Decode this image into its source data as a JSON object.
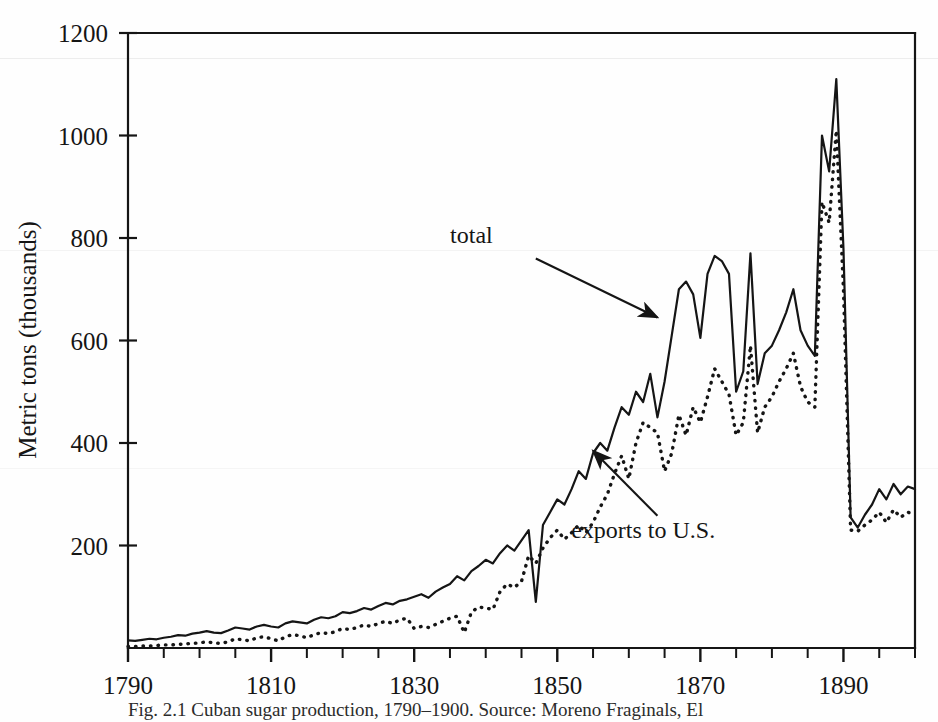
{
  "figure": {
    "caption": "Fig. 2.1  Cuban sugar production, 1790–1900. Source: Moreno Fraginals, El",
    "background_color": "#fefefe",
    "ink_color": "#151515"
  },
  "chart_data": {
    "type": "line",
    "title": "",
    "xlabel": "",
    "ylabel": "Metric tons (thousands)",
    "xlim": [
      1790,
      1900
    ],
    "ylim": [
      0,
      1200
    ],
    "xticks": [
      1790,
      1810,
      1830,
      1850,
      1870,
      1890
    ],
    "xtick_labels": [
      "1790",
      "1810",
      "1830",
      "1850",
      "1870",
      "1890"
    ],
    "xminor_step": 5,
    "yticks": [
      0,
      200,
      400,
      600,
      800,
      1000,
      1200
    ],
    "ytick_labels": [
      "",
      "200",
      "400",
      "600",
      "800",
      "1000",
      "1200"
    ],
    "grid": false,
    "legend_position": "inline-annotations",
    "annotations": [
      {
        "label": "total",
        "text_x": 1838,
        "text_y": 790,
        "arrow_from": [
          1847,
          760
        ],
        "arrow_to": [
          1864,
          645
        ],
        "series": "total"
      },
      {
        "label": "exports to U.S.",
        "text_x": 1862,
        "text_y": 215,
        "arrow_from": [
          1864,
          258
        ],
        "arrow_to": [
          1855,
          385
        ],
        "series": "exports to U.S."
      }
    ],
    "x": [
      1790,
      1791,
      1792,
      1793,
      1794,
      1795,
      1796,
      1797,
      1798,
      1799,
      1800,
      1801,
      1802,
      1803,
      1804,
      1805,
      1806,
      1807,
      1808,
      1809,
      1810,
      1811,
      1812,
      1813,
      1814,
      1815,
      1816,
      1817,
      1818,
      1819,
      1820,
      1821,
      1822,
      1823,
      1824,
      1825,
      1826,
      1827,
      1828,
      1829,
      1830,
      1831,
      1832,
      1833,
      1834,
      1835,
      1836,
      1837,
      1838,
      1839,
      1840,
      1841,
      1842,
      1843,
      1844,
      1845,
      1846,
      1847,
      1848,
      1849,
      1850,
      1851,
      1852,
      1853,
      1854,
      1855,
      1856,
      1857,
      1858,
      1859,
      1860,
      1861,
      1862,
      1863,
      1864,
      1865,
      1866,
      1867,
      1868,
      1869,
      1870,
      1871,
      1872,
      1873,
      1874,
      1875,
      1876,
      1877,
      1878,
      1879,
      1880,
      1881,
      1882,
      1883,
      1884,
      1885,
      1886,
      1887,
      1888,
      1889,
      1890,
      1891,
      1892,
      1893,
      1894,
      1895,
      1896,
      1897,
      1898,
      1899,
      1900
    ],
    "series": [
      {
        "name": "total",
        "style": "solid",
        "color": "#151515",
        "values": [
          15,
          14,
          16,
          18,
          17,
          20,
          22,
          25,
          24,
          28,
          30,
          33,
          30,
          29,
          34,
          40,
          38,
          36,
          42,
          45,
          42,
          40,
          48,
          52,
          50,
          48,
          55,
          60,
          58,
          62,
          70,
          68,
          72,
          78,
          75,
          82,
          88,
          85,
          92,
          95,
          100,
          105,
          98,
          110,
          118,
          125,
          140,
          132,
          150,
          160,
          172,
          165,
          185,
          200,
          190,
          210,
          230,
          90,
          240,
          265,
          290,
          280,
          310,
          345,
          330,
          380,
          400,
          385,
          430,
          470,
          455,
          500,
          480,
          535,
          450,
          520,
          610,
          700,
          715,
          690,
          605,
          730,
          765,
          755,
          730,
          500,
          540,
          770,
          515,
          575,
          590,
          620,
          655,
          700,
          620,
          590,
          570,
          1000,
          930,
          1110,
          780,
          255,
          235,
          260,
          280,
          310,
          290,
          320,
          300,
          315,
          310
        ]
      },
      {
        "name": "exports to U.S.",
        "style": "dotted",
        "color": "#151515",
        "values": [
          3,
          3,
          4,
          4,
          5,
          6,
          6,
          7,
          8,
          9,
          10,
          12,
          10,
          9,
          12,
          18,
          16,
          14,
          20,
          22,
          18,
          14,
          22,
          26,
          24,
          20,
          26,
          30,
          28,
          32,
          38,
          36,
          40,
          45,
          42,
          48,
          52,
          48,
          55,
          58,
          38,
          42,
          40,
          46,
          52,
          58,
          62,
          30,
          70,
          80,
          78,
          75,
          110,
          125,
          118,
          130,
          180,
          165,
          195,
          215,
          230,
          212,
          225,
          240,
          225,
          245,
          275,
          300,
          340,
          375,
          330,
          400,
          440,
          430,
          420,
          345,
          380,
          455,
          415,
          470,
          440,
          490,
          545,
          520,
          495,
          415,
          440,
          590,
          420,
          470,
          490,
          520,
          545,
          575,
          510,
          480,
          470,
          870,
          830,
          1010,
          700,
          230,
          228,
          240,
          250,
          265,
          245,
          270,
          255,
          265,
          260
        ]
      }
    ]
  }
}
